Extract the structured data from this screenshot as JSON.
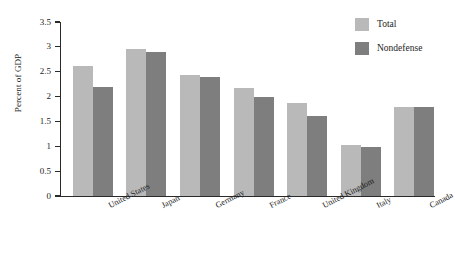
{
  "chart_data": {
    "type": "bar",
    "title": "",
    "subtitle": "",
    "xlabel": "",
    "ylabel": "Percent of GDP",
    "ylim": [
      0,
      3.5
    ],
    "ytick_labels": [
      "0",
      "0.5",
      "1",
      "1.5",
      "2",
      "2.5",
      "3",
      "3.5"
    ],
    "ytick_values": [
      0,
      0.5,
      1,
      1.5,
      2,
      2.5,
      3,
      3.5
    ],
    "grid": false,
    "legend_position": "top-right",
    "categories": [
      "United States",
      "Japan",
      "Germany",
      "France",
      "United Kingdom",
      "Italy",
      "Canada"
    ],
    "series": [
      {
        "name": "Total",
        "color": "#b9b9b9",
        "values": [
          2.62,
          2.95,
          2.43,
          2.18,
          1.88,
          1.02,
          1.8
        ]
      },
      {
        "name": "Nondefense",
        "color": "#7e7e7e",
        "values": [
          2.2,
          2.89,
          2.39,
          2.0,
          1.6,
          0.98,
          1.8
        ]
      }
    ]
  },
  "legend": {
    "items": [
      {
        "label": "Total",
        "color": "#b9b9b9"
      },
      {
        "label": "Nondefense",
        "color": "#7e7e7e"
      }
    ]
  },
  "axis": {
    "y_title": "Percent of GDP"
  }
}
